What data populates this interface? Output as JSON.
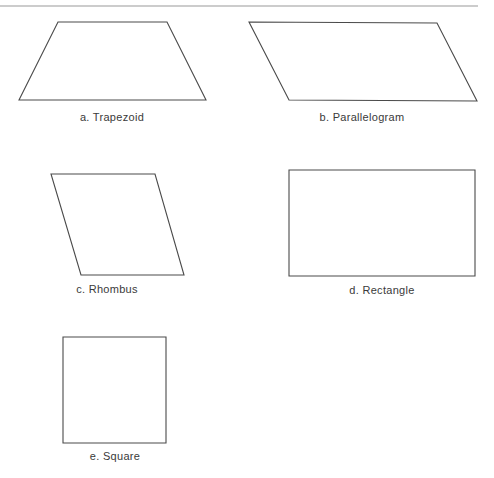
{
  "figure": {
    "colors": {
      "stroke": "#4a4a4a",
      "rule": "#9a9a9a",
      "background": "#ffffff"
    },
    "shapes": [
      {
        "id": "trapezoid",
        "label": "a. Trapezoid",
        "points": [
          [
            58,
            22
          ],
          [
            167,
            22
          ],
          [
            206,
            100
          ],
          [
            19,
            100
          ]
        ],
        "label_pos": [
          112,
          118
        ]
      },
      {
        "id": "parallelogram",
        "label": "b. Parallelogram",
        "points": [
          [
            249,
            22
          ],
          [
            437,
            23
          ],
          [
            477,
            101
          ],
          [
            289,
            100
          ]
        ],
        "label_pos": [
          362,
          118
        ]
      },
      {
        "id": "rhombus",
        "label": "c. Rhombus",
        "points": [
          [
            51,
            174
          ],
          [
            155,
            174
          ],
          [
            184,
            275
          ],
          [
            81,
            275
          ]
        ],
        "label_pos": [
          107,
          288
        ]
      },
      {
        "id": "rectangle",
        "label": "d. Rectangle",
        "points": [
          [
            289,
            170
          ],
          [
            475,
            170
          ],
          [
            475,
            276
          ],
          [
            289,
            276
          ]
        ],
        "label_pos": [
          382,
          290
        ]
      },
      {
        "id": "square",
        "label": "e. Square",
        "points": [
          [
            63,
            337
          ],
          [
            166,
            337
          ],
          [
            166,
            443
          ],
          [
            63,
            443
          ]
        ],
        "label_pos": [
          115,
          455
        ]
      }
    ]
  }
}
